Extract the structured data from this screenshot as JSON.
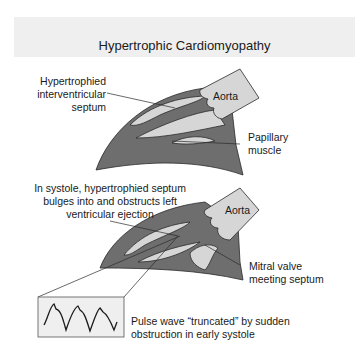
{
  "title": "Hypertrophic Cardiomyopathy",
  "colors": {
    "header_band": "#efefef",
    "myocardium": "#6e6e6e",
    "chamber": "#d6d6d6",
    "outline": "#2a2a2a"
  },
  "panel_top": {
    "labels": {
      "septum": [
        "Hypertrophied",
        "interventricular",
        "septum"
      ],
      "aorta": "Aorta",
      "papillary": [
        "Papillary",
        "muscle"
      ]
    }
  },
  "panel_bottom": {
    "labels": {
      "systole": [
        "In systole, hypertrophied septum",
        "bulges into and obstructs left",
        "ventricular ejection"
      ],
      "aorta": "Aorta",
      "mitral": [
        "Mitral valve",
        "meeting septum"
      ],
      "pulse": [
        "Pulse wave “truncated” by sudden",
        "obstruction in early systole"
      ]
    }
  }
}
